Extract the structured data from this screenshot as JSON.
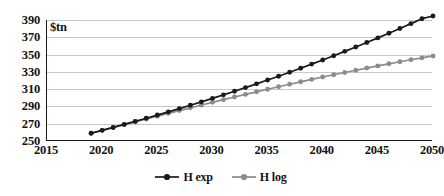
{
  "chart_data": {
    "type": "line",
    "title": "",
    "subtitle": "",
    "xlabel": "",
    "ylabel": "$tn",
    "unit_label": "$tn",
    "xlim": [
      2015,
      2050
    ],
    "ylim": [
      250,
      390
    ],
    "xticks": [
      2015,
      2020,
      2025,
      2030,
      2035,
      2040,
      2045,
      2050
    ],
    "yticks": [
      250,
      270,
      290,
      310,
      330,
      350,
      370,
      390
    ],
    "grid": "horizontal",
    "legend_position": "bottom-center",
    "x": [
      2019,
      2020,
      2021,
      2022,
      2023,
      2024,
      2025,
      2026,
      2027,
      2028,
      2029,
      2030,
      2031,
      2032,
      2033,
      2034,
      2035,
      2036,
      2037,
      2038,
      2039,
      2040,
      2041,
      2042,
      2043,
      2044,
      2045,
      2046,
      2047,
      2048,
      2049,
      2050
    ],
    "series": [
      {
        "name": "H exp",
        "color": "#1a1a1a",
        "marker": "circle",
        "values": [
          259.0,
          262.3,
          265.7,
          269.2,
          272.7,
          276.3,
          280.0,
          283.7,
          287.5,
          291.4,
          295.3,
          299.3,
          303.4,
          307.6,
          311.8,
          316.1,
          320.5,
          325.0,
          329.6,
          334.2,
          339.0,
          343.8,
          348.7,
          353.7,
          358.8,
          364.0,
          369.3,
          374.7,
          380.2,
          385.8,
          391.5,
          397.3
        ]
      },
      {
        "name": "H log",
        "color": "#8c8c8c",
        "marker": "circle",
        "values": [
          259.0,
          262.3,
          265.6,
          268.9,
          272.2,
          275.5,
          278.7,
          282.0,
          285.2,
          288.4,
          291.6,
          294.7,
          297.8,
          300.9,
          303.9,
          306.9,
          309.9,
          312.8,
          315.7,
          318.5,
          321.3,
          324.0,
          326.7,
          329.3,
          331.9,
          334.4,
          336.9,
          339.3,
          341.7,
          344.0,
          346.2,
          348.4
        ]
      }
    ],
    "legend": [
      {
        "label": "H exp",
        "color": "#1a1a1a"
      },
      {
        "label": "H log",
        "color": "#8c8c8c"
      }
    ]
  }
}
